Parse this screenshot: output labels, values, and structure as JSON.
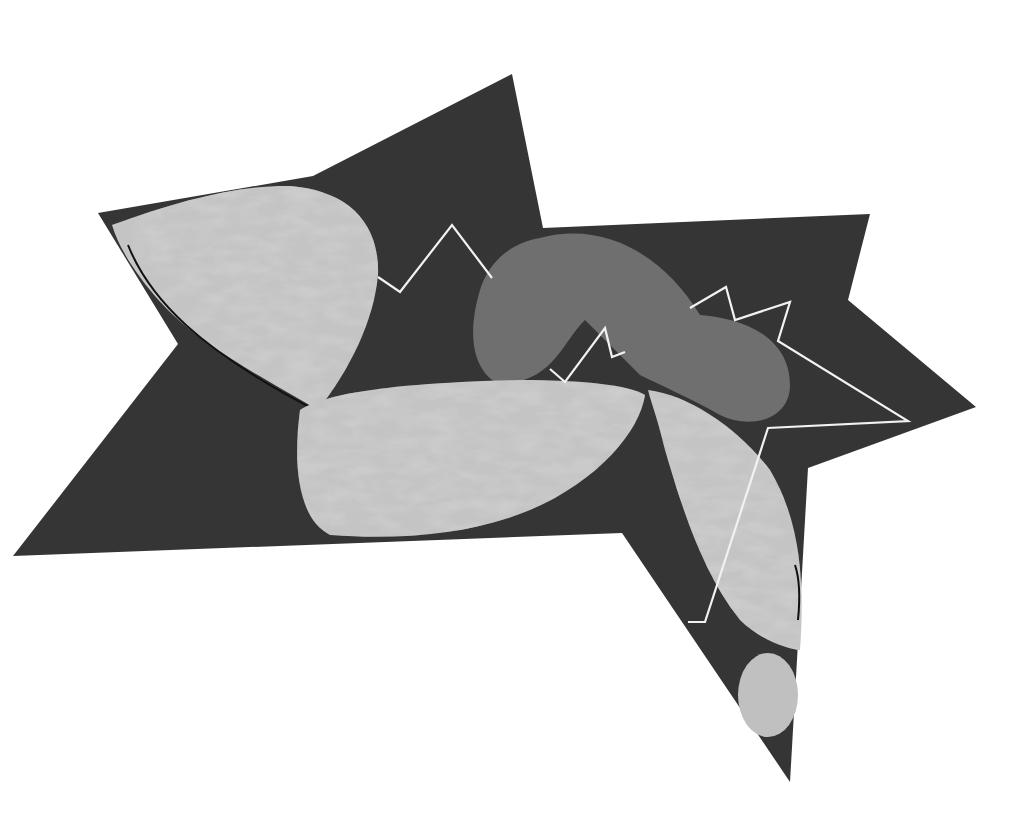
{
  "artwork": {
    "background": "#ffffff",
    "colors": {
      "star": "#353535",
      "light_shape": "#c4c4c4",
      "light_shape_texture": "#a8a8a8",
      "mid_shape": "#6f6f6f",
      "zigzag_line": "#f2f2f2",
      "outline": "#111111"
    },
    "shapes": [
      {
        "name": "dark-star"
      },
      {
        "name": "upper-left-light-blob"
      },
      {
        "name": "center-light-ellipse"
      },
      {
        "name": "right-light-leaf"
      },
      {
        "name": "small-light-circle"
      },
      {
        "name": "gray-curved-tube"
      },
      {
        "name": "white-zigzag-line"
      }
    ]
  }
}
